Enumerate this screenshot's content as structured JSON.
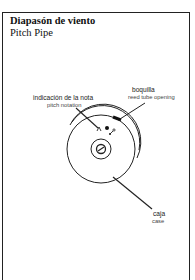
{
  "header": {
    "title_es": "Diapasón de viento",
    "title_en": "Pitch Pipe"
  },
  "labels": {
    "pitch_notation": {
      "es": "indicación de la nota",
      "en": "pitch notation"
    },
    "reed_tube_opening": {
      "es": "boquilla",
      "en": "reed tube opening"
    },
    "case": {
      "es": "caja",
      "en": "case"
    }
  },
  "icons": {
    "diagram": "pitch-pipe-illustration"
  },
  "colors": {
    "ink": "#222222",
    "background": "#ffffff"
  }
}
